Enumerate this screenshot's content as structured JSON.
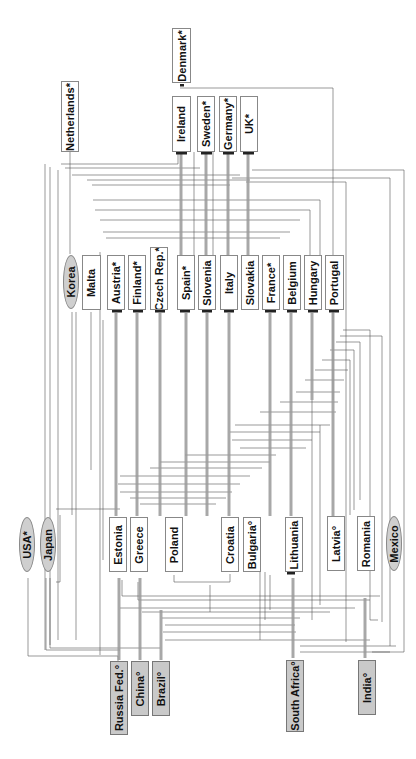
{
  "diagram": {
    "type": "directed-network",
    "orientation": "rotated-90-ccw",
    "colors": {
      "line": "#555555",
      "thick_line": "#9a9a9a",
      "box_border": "#888888",
      "shaded_fill": "#c9c9c9",
      "ellipse_fill": "#cfcfcf"
    },
    "nodes": [
      {
        "id": "denmark",
        "label": "Denmark*",
        "shape": "box",
        "x": 172,
        "y": 28,
        "w": 19,
        "h": 55
      },
      {
        "id": "netherlands",
        "label": "Netherlands*",
        "shape": "box",
        "x": 61,
        "y": 81,
        "w": 18,
        "h": 71
      },
      {
        "id": "ireland",
        "label": "Ireland",
        "shape": "box",
        "x": 172,
        "y": 96,
        "w": 19,
        "h": 56
      },
      {
        "id": "sweden",
        "label": "Sweden*",
        "shape": "box",
        "x": 197,
        "y": 96,
        "w": 18,
        "h": 56
      },
      {
        "id": "germany",
        "label": "Germany*",
        "shape": "box",
        "x": 219,
        "y": 96,
        "w": 18,
        "h": 56
      },
      {
        "id": "uk",
        "label": "UK*",
        "shape": "box",
        "x": 240,
        "y": 96,
        "w": 18,
        "h": 56
      },
      {
        "id": "korea",
        "label": "Korea",
        "shape": "ellipse",
        "x": 63,
        "y": 255,
        "w": 16,
        "h": 54
      },
      {
        "id": "malta",
        "label": "Malta",
        "shape": "box",
        "x": 82,
        "y": 255,
        "w": 19,
        "h": 55
      },
      {
        "id": "austria",
        "label": "Austria*",
        "shape": "box",
        "x": 107,
        "y": 255,
        "w": 18,
        "h": 55
      },
      {
        "id": "finland",
        "label": "Finland*",
        "shape": "box",
        "x": 128,
        "y": 255,
        "w": 18,
        "h": 55
      },
      {
        "id": "czech",
        "label": "Czech Rep.*",
        "shape": "box",
        "x": 150,
        "y": 247,
        "w": 18,
        "h": 63
      },
      {
        "id": "spain",
        "label": "Spain*",
        "shape": "box",
        "x": 177,
        "y": 255,
        "w": 18,
        "h": 55
      },
      {
        "id": "slovenia",
        "label": "Slovenia",
        "shape": "box",
        "x": 198,
        "y": 255,
        "w": 18,
        "h": 55
      },
      {
        "id": "italy",
        "label": "Italy",
        "shape": "box",
        "x": 220,
        "y": 255,
        "w": 18,
        "h": 55
      },
      {
        "id": "slovakia",
        "label": "Slovakia",
        "shape": "box",
        "x": 241,
        "y": 255,
        "w": 18,
        "h": 55
      },
      {
        "id": "france",
        "label": "France*",
        "shape": "box",
        "x": 262,
        "y": 255,
        "w": 18,
        "h": 55
      },
      {
        "id": "belgium",
        "label": "Belgium",
        "shape": "box",
        "x": 283,
        "y": 255,
        "w": 18,
        "h": 55
      },
      {
        "id": "hungary",
        "label": "Hungary",
        "shape": "box",
        "x": 304,
        "y": 255,
        "w": 18,
        "h": 55
      },
      {
        "id": "portugal",
        "label": "Portugal",
        "shape": "box",
        "x": 325,
        "y": 255,
        "w": 19,
        "h": 55
      },
      {
        "id": "usa",
        "label": "USA*",
        "shape": "ellipse",
        "x": 19,
        "y": 517,
        "w": 16,
        "h": 55
      },
      {
        "id": "japan",
        "label": "Japan",
        "shape": "ellipse",
        "x": 40,
        "y": 517,
        "w": 16,
        "h": 55
      },
      {
        "id": "estonia",
        "label": "Estonia",
        "shape": "box",
        "x": 109,
        "y": 517,
        "w": 18,
        "h": 55
      },
      {
        "id": "greece",
        "label": "Greece",
        "shape": "box",
        "x": 130,
        "y": 517,
        "w": 18,
        "h": 55
      },
      {
        "id": "poland",
        "label": "Poland",
        "shape": "box",
        "x": 165,
        "y": 517,
        "w": 18,
        "h": 55
      },
      {
        "id": "croatia",
        "label": "Croatia",
        "shape": "box",
        "x": 221,
        "y": 517,
        "w": 18,
        "h": 55
      },
      {
        "id": "bulgaria",
        "label": "Bulgaria°",
        "shape": "box",
        "x": 243,
        "y": 517,
        "w": 18,
        "h": 55
      },
      {
        "id": "lithuania",
        "label": "Lithuania",
        "shape": "box",
        "x": 285,
        "y": 517,
        "w": 18,
        "h": 55
      },
      {
        "id": "latvia",
        "label": "Latvia°",
        "shape": "box",
        "x": 327,
        "y": 516,
        "w": 18,
        "h": 55
      },
      {
        "id": "romania",
        "label": "Romania",
        "shape": "box",
        "x": 357,
        "y": 516,
        "w": 18,
        "h": 55
      },
      {
        "id": "mexico",
        "label": "Mexico",
        "shape": "ellipse",
        "x": 386,
        "y": 516,
        "w": 16,
        "h": 55
      },
      {
        "id": "russia",
        "label": "Russia Fed.°",
        "shape": "shaded",
        "x": 110,
        "y": 661,
        "w": 18,
        "h": 74
      },
      {
        "id": "china",
        "label": "China°",
        "shape": "shaded",
        "x": 131,
        "y": 661,
        "w": 18,
        "h": 55
      },
      {
        "id": "brazil",
        "label": "Brazil°",
        "shape": "shaded",
        "x": 152,
        "y": 661,
        "w": 18,
        "h": 55
      },
      {
        "id": "southafrica",
        "label": "South Africa°",
        "shape": "shaded",
        "x": 286,
        "y": 660,
        "w": 18,
        "h": 72
      },
      {
        "id": "india",
        "label": "India°",
        "shape": "shaded",
        "x": 358,
        "y": 660,
        "w": 18,
        "h": 55
      }
    ]
  }
}
